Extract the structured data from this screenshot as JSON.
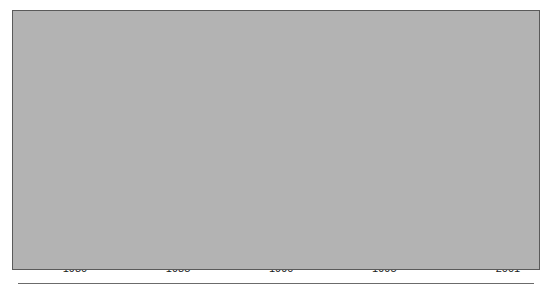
{
  "figure": {
    "background_color": "#b3b3b3",
    "page_color": "#ffffff",
    "frame_color": "#5a5a5a"
  },
  "axis": {
    "ylabel": "Percent",
    "y_ticks": [
      "0",
      "20",
      "40",
      "60",
      "80",
      "100"
    ],
    "x_ticks": [
      "1980",
      "1985",
      "1990",
      "1995",
      "2001"
    ]
  },
  "labels": {
    "white": "White, non-Hispanic",
    "black": "Black, non-Hispanic",
    "hispanic": "Hispanic",
    "total": "Total",
    "asian": "Asian/Pacific Islander"
  },
  "chart_data": {
    "type": "line",
    "title": "",
    "subtitle": "",
    "xlabel": "",
    "ylabel": "Percent",
    "xlim": [
      1980,
      2001
    ],
    "ylim": [
      0,
      100
    ],
    "grid": false,
    "legend": "inline-annotations",
    "x": [
      1980,
      1981,
      1982,
      1983,
      1984,
      1985,
      1986,
      1987,
      1988,
      1989,
      1990,
      1991,
      1992,
      1993,
      1994,
      1995,
      1996,
      1997,
      1998,
      1999,
      2000,
      2001
    ],
    "series": [
      {
        "name": "Asian/Pacific Islander",
        "style": "solid-thin",
        "color": "#3a3a3a",
        "values": [
          88.0,
          88.4,
          87.6,
          87.4,
          87.6,
          88.0,
          88.5,
          88.2,
          88.0,
          88.3,
          88.9,
          88.0,
          89.4,
          89.8,
          89.0,
          90.0,
          90.5,
          90.0,
          90.1,
          90.4,
          91.0,
          92.1
        ]
      },
      {
        "name": "White, non-Hispanic",
        "style": "dashed-thin",
        "color": "#3a3a3a",
        "values": [
          84.6,
          84.6,
          84.7,
          84.5,
          84.6,
          84.9,
          85.1,
          85.4,
          85.5,
          85.5,
          86.0,
          86.6,
          86.2,
          86.0,
          86.1,
          86.5,
          86.0,
          86.2,
          85.2,
          85.4,
          86.0,
          86.4
        ]
      },
      {
        "name": "Black, non-Hispanic",
        "style": "dashed-thick",
        "color": "#111111",
        "values": [
          75.0,
          75.6,
          76.0,
          77.0,
          76.4,
          76.0,
          78.0,
          79.0,
          80.0,
          81.0,
          81.4,
          82.1,
          81.6,
          81.9,
          82.0,
          81.5,
          80.5,
          80.0,
          80.0,
          81.0,
          83.0,
          85.0
        ]
      },
      {
        "name": "Hispanic",
        "style": "solid-thick",
        "color": "#111111",
        "values": [
          57.0,
          58.0,
          59.0,
          60.5,
          60.0,
          61.5,
          65.0,
          66.5,
          64.5,
          63.5,
          63.5,
          65.0,
          61.0,
          57.5,
          57.5,
          57.5,
          57.0,
          62.5,
          62.0,
          61.5,
          61.0,
          65.0
        ]
      }
    ]
  }
}
